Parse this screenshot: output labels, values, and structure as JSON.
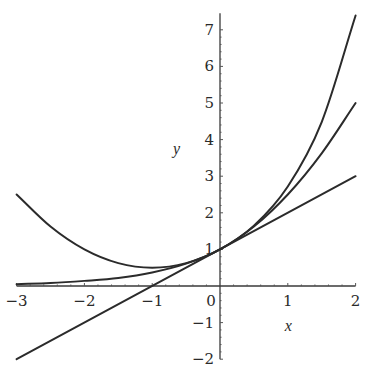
{
  "chart_data": {
    "type": "line",
    "title": "",
    "xlabel": "x",
    "ylabel": "y",
    "xlim": [
      -3,
      2
    ],
    "ylim": [
      -2,
      7.4
    ],
    "grid": false,
    "legend": null,
    "x_ticks": [
      -3,
      -2,
      -1,
      0,
      1,
      2
    ],
    "x_tick_labels": [
      "−3",
      "−2",
      "−1",
      "0",
      "1",
      "2"
    ],
    "y_ticks": [
      -2,
      -1,
      1,
      2,
      3,
      4,
      5,
      6,
      7
    ],
    "y_tick_labels": [
      "−2",
      "−1",
      "1",
      "2",
      "3",
      "4",
      "5",
      "6",
      "7"
    ],
    "series": [
      {
        "name": "exp(x)",
        "x": [
          -3,
          -2.5,
          -2,
          -1.5,
          -1,
          -0.5,
          0,
          0.5,
          1,
          1.5,
          2
        ],
        "values": [
          0.05,
          0.08,
          0.14,
          0.22,
          0.37,
          0.61,
          1.0,
          1.65,
          2.72,
          4.48,
          7.39
        ]
      },
      {
        "name": "1 + x + x^2/2",
        "x": [
          -3,
          -2.5,
          -2,
          -1.5,
          -1,
          -0.5,
          0,
          0.5,
          1,
          1.5,
          2
        ],
        "values": [
          2.5,
          1.625,
          1.0,
          0.625,
          0.5,
          0.625,
          1.0,
          1.625,
          2.5,
          3.625,
          5.0
        ]
      },
      {
        "name": "1 + x",
        "x": [
          -3,
          2
        ],
        "values": [
          -2,
          3
        ]
      }
    ]
  },
  "plot_area": {
    "origin_px": [
      220,
      286
    ],
    "px_per_unit_x": 67.8,
    "px_per_unit_y": 36.6
  }
}
